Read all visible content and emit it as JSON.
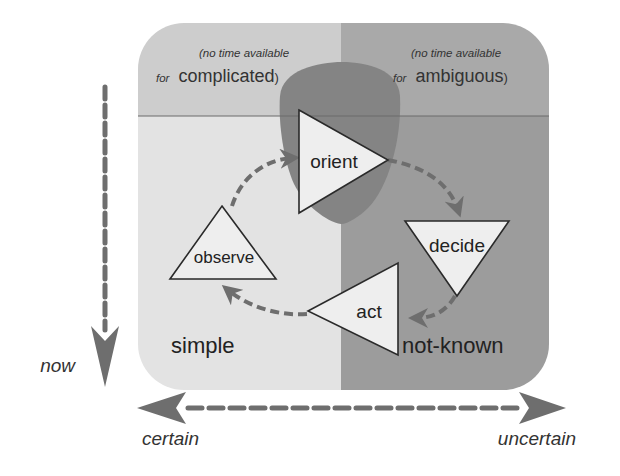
{
  "diagram": {
    "type": "OODA loop over certainty / time quadrant",
    "quadrants": {
      "top_left": {
        "note_italic": "(no time available",
        "note_prefix": "for",
        "note_word": "complicated",
        "note_suffix": ")"
      },
      "top_right": {
        "note_italic": "(no time available",
        "note_prefix": "for",
        "note_word": "ambiguous",
        "note_suffix": ")"
      },
      "bottom_left": {
        "label": "simple"
      },
      "bottom_right": {
        "label": "not-known"
      }
    },
    "loop_nodes": {
      "orient": "orient",
      "decide": "decide",
      "act": "act",
      "observe": "observe"
    },
    "axes": {
      "vertical": {
        "label": "now",
        "direction": "down"
      },
      "horizontal": {
        "left_label": "certain",
        "right_label": "uncertain",
        "direction": "both"
      }
    },
    "colors": {
      "top_left": "#cdcdcd",
      "top_right": "#a9a9a9",
      "bottom_left": "#e3e3e3",
      "bottom_right": "#9c9c9c",
      "shield": "#848484",
      "arrow": "#6e6e6e",
      "node_fill": "#eeeeee",
      "divider": "#6a6a6a",
      "text": "#222222"
    }
  }
}
